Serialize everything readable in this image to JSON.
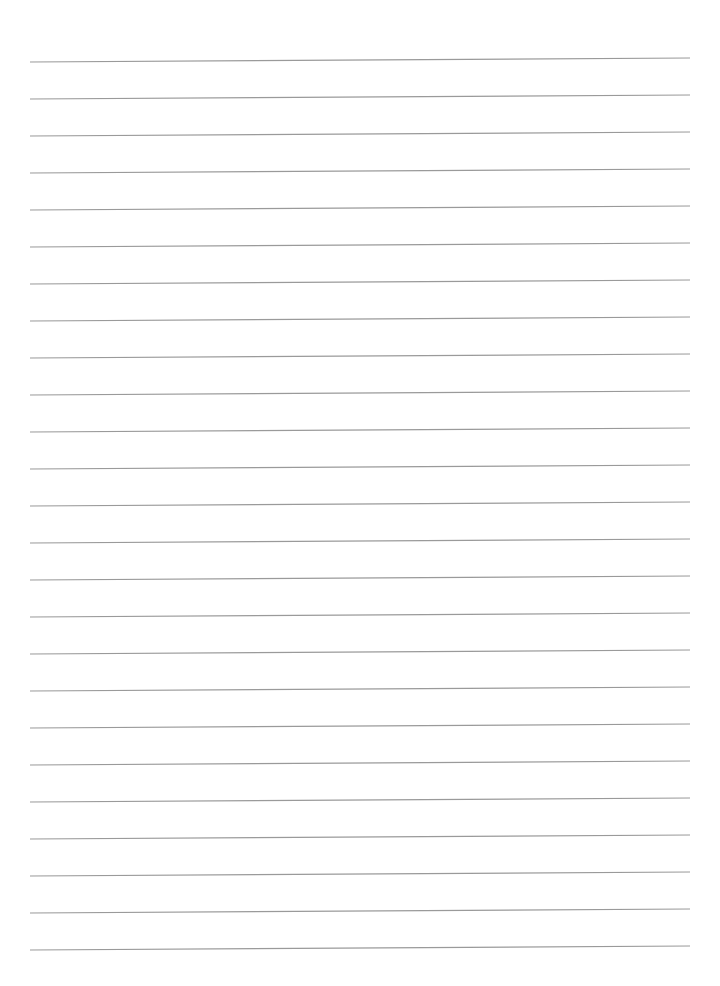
{
  "page": {
    "type": "blank-ruled-sheet",
    "background_color": "#ffffff",
    "width": 720,
    "height": 986
  },
  "ruling": {
    "line_color": "#9a9a9a",
    "line_count": 25,
    "first_line_y_left": 62,
    "first_line_y_right": 58,
    "line_spacing": 37,
    "x_start": 30,
    "x_end": 690,
    "line_width": 1.2
  }
}
